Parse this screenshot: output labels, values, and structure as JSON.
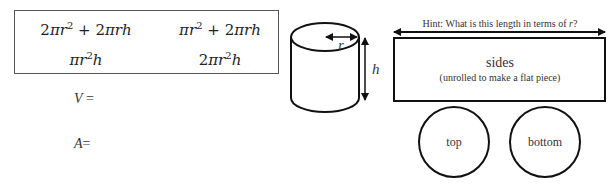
{
  "formulas": {
    "f1": {
      "coef": "2",
      "a": "πr",
      "a_exp": "2",
      "plus": " + ",
      "b_coef": "2",
      "b": "πrh"
    },
    "f2": {
      "coef": "",
      "a": "πr",
      "a_exp": "2",
      "plus": " + ",
      "b_coef": "2",
      "b": "πrh"
    },
    "f3": {
      "coef": "",
      "a": "πr",
      "a_exp": "2",
      "tail": "h"
    },
    "f4": {
      "coef": "2",
      "a": "πr",
      "a_exp": "2",
      "tail": "h"
    }
  },
  "equations": {
    "volume": {
      "var": "V",
      "op": " ="
    },
    "area": {
      "var": "A",
      "op": "="
    }
  },
  "cylinder": {
    "radius_label": "r",
    "height_label": "h"
  },
  "net": {
    "hint": "Hint: What is this length in terms of r?",
    "hint_prefix": "Hint: What is this length in terms of ",
    "hint_var": "r",
    "hint_suffix": "?",
    "sides_label": "sides",
    "sides_sublabel": "(unrolled to make a flat piece)",
    "top_label": "top",
    "bottom_label": "bottom"
  }
}
